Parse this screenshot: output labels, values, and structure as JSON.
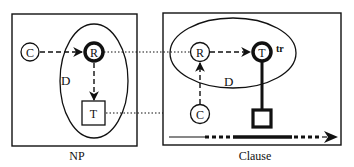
{
  "colors": {
    "ink": "#111111",
    "background": "#ffffff"
  },
  "panels": {
    "np": {
      "caption": "NP",
      "nodes": {
        "c": "C",
        "r": "R",
        "t": "T"
      },
      "ellipse_label": "D"
    },
    "clause": {
      "caption": "Clause",
      "nodes": {
        "r": "R",
        "t": "T",
        "c": "C"
      },
      "trace_label": "tr",
      "ellipse_label": "D"
    }
  },
  "connections": [
    {
      "from": "np.r",
      "to": "clause.r",
      "style": "dotted"
    },
    {
      "from": "np.t",
      "to": "clause.c",
      "style": "dotted"
    }
  ],
  "edges": [
    {
      "from": "np.c",
      "to": "np.r",
      "style": "dashed-arrow"
    },
    {
      "from": "np.r",
      "to": "np.t",
      "style": "dashed-arrow"
    },
    {
      "from": "clause.r",
      "to": "clause.t",
      "style": "dashed-arrow"
    },
    {
      "from": "clause.c",
      "to": "clause.r",
      "style": "dashed-arrow"
    },
    {
      "from": "clause.t",
      "to": "clause.square",
      "style": "thick-line"
    }
  ],
  "timeline": {
    "segments": [
      "thin",
      "dotted",
      "thick",
      "dotted",
      "arrowhead"
    ]
  }
}
